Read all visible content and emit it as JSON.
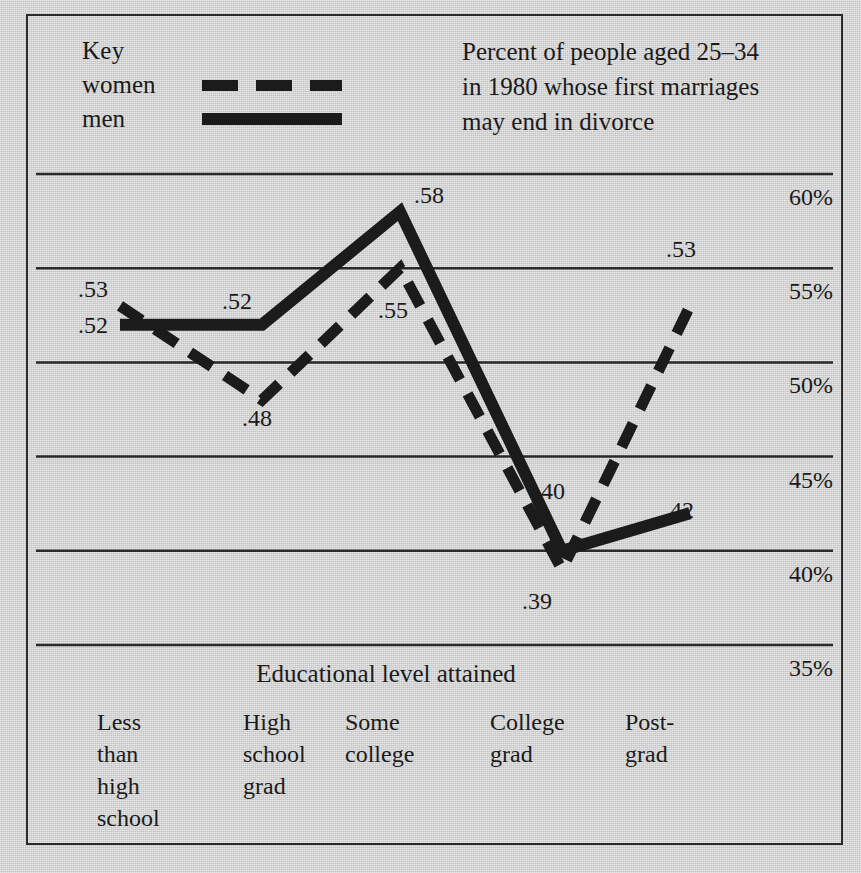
{
  "legend": {
    "title": "Key",
    "entries": [
      {
        "label": "women",
        "style": "dashed"
      },
      {
        "label": "men",
        "style": "solid"
      }
    ]
  },
  "caption": "Percent of people aged 25–34 in 1980 whose first marriages may end in divorce",
  "axis": {
    "x_title": "Educational level attained",
    "y_ticks": [
      "60%",
      "55%",
      "50%",
      "45%",
      "40%",
      "35%"
    ]
  },
  "colors": {
    "ink": "#1b1b1b",
    "paper": "#cfcfcf",
    "gridline": "#2a2a2a"
  },
  "chart_data": {
    "type": "line",
    "title": "Percent of people aged 25–34 in 1980 whose first marriages may end in divorce",
    "xlabel": "Educational level attained",
    "ylabel": "",
    "categories": [
      "Less than high school",
      "High school grad",
      "Some college",
      "College grad",
      "Post-grad"
    ],
    "series": [
      {
        "name": "women",
        "style": "dashed",
        "values": [
          0.53,
          0.48,
          0.55,
          0.39,
          0.53
        ],
        "labels": [
          ".53",
          ".48",
          ".55",
          ".39",
          ".53"
        ]
      },
      {
        "name": "men",
        "style": "solid",
        "values": [
          0.52,
          0.52,
          0.58,
          0.4,
          0.42
        ],
        "labels": [
          ".52",
          ".52",
          ".58",
          ".40",
          ".42"
        ]
      }
    ],
    "ylim": [
      0.35,
      0.6
    ],
    "ytick_values": [
      0.6,
      0.55,
      0.5,
      0.45,
      0.4,
      0.35
    ],
    "ytick_labels": [
      "60%",
      "55%",
      "50%",
      "45%",
      "40%",
      "35%"
    ],
    "grid": "horizontal",
    "legend_position": "top-left"
  },
  "point_labels": [
    {
      "text": ".53",
      "x": 78,
      "y": 276
    },
    {
      "text": ".52",
      "x": 78,
      "y": 312
    },
    {
      "text": ".52",
      "x": 222,
      "y": 288
    },
    {
      "text": ".48",
      "x": 242,
      "y": 405
    },
    {
      "text": ".58",
      "x": 414,
      "y": 182
    },
    {
      "text": ".55",
      "x": 378,
      "y": 297
    },
    {
      "text": ".40",
      "x": 535,
      "y": 478
    },
    {
      "text": ".39",
      "x": 522,
      "y": 588
    },
    {
      "text": ".42",
      "x": 664,
      "y": 497
    },
    {
      "text": ".53",
      "x": 666,
      "y": 236
    }
  ],
  "x_categories_display": [
    {
      "text": "Less\nthan\nhigh\nschool",
      "x": 97
    },
    {
      "text": "High\nschool\ngrad",
      "x": 243
    },
    {
      "text": "Some\ncollege",
      "x": 345
    },
    {
      "text": "College\ngrad",
      "x": 490
    },
    {
      "text": "Post-\ngrad",
      "x": 625
    }
  ]
}
